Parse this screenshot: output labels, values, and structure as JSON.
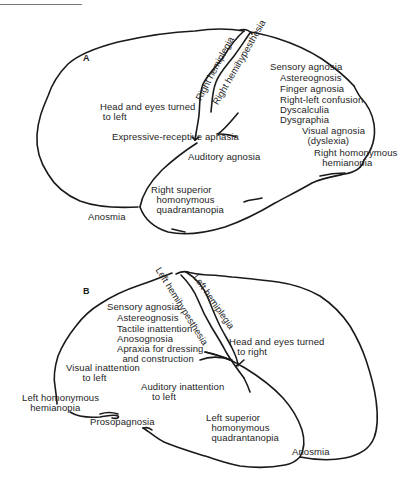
{
  "figure": {
    "panels": [
      {
        "id": "A",
        "label": "A",
        "hemisphere": "left hemisphere lesion (lateral view)",
        "labels": {
          "right_hemiplegia": "Right hemiplegia",
          "right_hemihypesthesia": "Right hemihypesthesia",
          "head_eyes": "Head and eyes turned\n to left",
          "aphasia": "Expressive-receptive aphasia",
          "auditory": "Auditory agnosia",
          "quadrantanopia": "Right superior\n  homonymous\n  quadrantanopia",
          "anosmia": "Anosmia",
          "sensory_agnosia": "Sensory agnosia",
          "astereognosis": "Astereognosis",
          "finger_agnosia": "Finger agnosia",
          "right_left_confusion": "Right-left confusion",
          "dyscalculia": "Dyscalculia",
          "dysgraphia": "Dysgraphia",
          "visual_agnosia": "Visual agnosia\n  (dyslexia)",
          "hemianopia": "Right homonymous\n   hemianopia"
        }
      },
      {
        "id": "B",
        "label": "B",
        "hemisphere": "right hemisphere lesion (lateral view)",
        "labels": {
          "left_hemihypesthesia": "Left hemihypesthesia",
          "left_hemiplegia": "Left hemiplegia",
          "sensory_agnosia": "Sensory agnosia",
          "astereognosis": "Astereognosis",
          "tactile_inattention": "Tactile inattention",
          "anosognosia": "Anosognosia",
          "apraxia": "Apraxia for dressing\n  and construction",
          "head_eyes": "Head and eyes turned\n   to right",
          "visual_inattention": "Visual inattention\n      to left",
          "auditory_inattention": "Auditory inattention\n    to left",
          "hemianopia": "Left homonymous\n   hemianopia",
          "prosopagnosia": "Prosopagnosia",
          "quadrantanopia": "Left superior\n  homonymous\n  quadrantanopia",
          "anosmia": "Anosmia"
        }
      }
    ]
  }
}
